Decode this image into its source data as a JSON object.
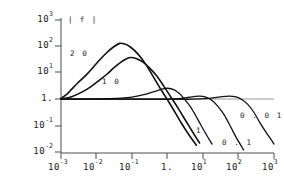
{
  "chart_data": {
    "type": "line",
    "title": "",
    "subtitle": "",
    "ylabel": "| f |",
    "xlabel": "",
    "xscale": "log",
    "yscale": "log",
    "xlim": [
      0.001,
      1000
    ],
    "ylim": [
      0.01,
      1000
    ],
    "grid": false,
    "legend_position": "inline-annotations",
    "axis_caption": "| f |",
    "x_ticks": [
      {
        "value": 0.001,
        "mantissa": "10",
        "exponent": "-3",
        "label": "10^-3"
      },
      {
        "value": 0.01,
        "mantissa": "10",
        "exponent": "-2",
        "label": "10^-2"
      },
      {
        "value": 0.1,
        "mantissa": "10",
        "exponent": "-1",
        "label": "10^-1"
      },
      {
        "value": 1,
        "mantissa": "1.",
        "exponent": "",
        "label": "1."
      },
      {
        "value": 10,
        "mantissa": "10",
        "exponent": "1",
        "label": "10^1"
      },
      {
        "value": 100,
        "mantissa": "10",
        "exponent": "2",
        "label": "10^2"
      },
      {
        "value": 1000,
        "mantissa": "10",
        "exponent": "3",
        "label": "10^3"
      }
    ],
    "y_ticks": [
      {
        "value": 1000,
        "mantissa": "10",
        "exponent": "3",
        "label": "10^3"
      },
      {
        "value": 100,
        "mantissa": "10",
        "exponent": "2",
        "label": "10^2"
      },
      {
        "value": 10,
        "mantissa": "10",
        "exponent": "1",
        "label": "10^1"
      },
      {
        "value": 1,
        "mantissa": "1.",
        "exponent": "",
        "label": "1."
      },
      {
        "value": 0.1,
        "mantissa": "10",
        "exponent": "-1",
        "label": "10^-1"
      },
      {
        "value": 0.01,
        "mantissa": "10",
        "exponent": "-2",
        "label": "10^-2"
      }
    ],
    "series": [
      {
        "name": "20",
        "label": "2 0",
        "label_x": 0.0045,
        "label_y": 33,
        "peak_x": 0.045,
        "peak_y": 130,
        "color": "#111111",
        "width": 1.6,
        "points": [
          [
            0.001,
            1.05
          ],
          [
            0.0015,
            1.6
          ],
          [
            0.002,
            2.4
          ],
          [
            0.003,
            4.2
          ],
          [
            0.005,
            8.0
          ],
          [
            0.008,
            16
          ],
          [
            0.012,
            30
          ],
          [
            0.02,
            60
          ],
          [
            0.03,
            95
          ],
          [
            0.045,
            130
          ],
          [
            0.06,
            125
          ],
          [
            0.09,
            95
          ],
          [
            0.15,
            50
          ],
          [
            0.25,
            20
          ],
          [
            0.4,
            7.0
          ],
          [
            0.7,
            2.0
          ],
          [
            1.0,
            0.95
          ],
          [
            1.6,
            0.33
          ],
          [
            2.5,
            0.12
          ],
          [
            4.0,
            0.045
          ],
          [
            6.5,
            0.018
          ],
          [
            10,
            0.0085
          ]
        ]
      },
      {
        "name": "10",
        "label": "1 0",
        "label_x": 0.022,
        "label_y": 5.5,
        "peak_x": 0.09,
        "peak_y": 38,
        "color": "#111111",
        "width": 1.6,
        "points": [
          [
            0.001,
            1.02
          ],
          [
            0.002,
            1.25
          ],
          [
            0.004,
            1.9
          ],
          [
            0.007,
            3.0
          ],
          [
            0.012,
            5.2
          ],
          [
            0.02,
            9.0
          ],
          [
            0.03,
            15
          ],
          [
            0.05,
            26
          ],
          [
            0.07,
            34
          ],
          [
            0.09,
            38
          ],
          [
            0.13,
            35
          ],
          [
            0.2,
            26
          ],
          [
            0.3,
            16
          ],
          [
            0.5,
            7.5
          ],
          [
            0.8,
            3.0
          ],
          [
            1.2,
            1.3
          ],
          [
            2.0,
            0.45
          ],
          [
            3.2,
            0.16
          ],
          [
            5.0,
            0.06
          ],
          [
            8.0,
            0.022
          ],
          [
            13,
            0.0095
          ]
        ]
      },
      {
        "name": "1",
        "label": "1",
        "label_x": 25,
        "label_y": 0.1,
        "peak_x": 1.0,
        "peak_y": 2.6,
        "color": "#111111",
        "width": 1.3,
        "points": [
          [
            0.001,
            1.0
          ],
          [
            0.01,
            1.02
          ],
          [
            0.05,
            1.1
          ],
          [
            0.1,
            1.2
          ],
          [
            0.2,
            1.45
          ],
          [
            0.4,
            1.9
          ],
          [
            0.7,
            2.4
          ],
          [
            1.0,
            2.6
          ],
          [
            1.5,
            2.3
          ],
          [
            2.2,
            1.6
          ],
          [
            3.0,
            1.0
          ],
          [
            4.5,
            0.5
          ],
          [
            7.0,
            0.18
          ],
          [
            11,
            0.06
          ],
          [
            18,
            0.02
          ],
          [
            28,
            0.0085
          ]
        ]
      },
      {
        "name": "0.1",
        "label": "0 . 1",
        "label_x": 220,
        "label_y": 0.045,
        "peak_x": 8,
        "peak_y": 1.3,
        "color": "#111111",
        "width": 1.3,
        "points": [
          [
            0.001,
            1.0
          ],
          [
            0.1,
            1.0
          ],
          [
            0.5,
            1.0
          ],
          [
            1.0,
            1.0
          ],
          [
            2.0,
            1.05
          ],
          [
            3.5,
            1.15
          ],
          [
            5.5,
            1.25
          ],
          [
            8.0,
            1.3
          ],
          [
            12,
            1.2
          ],
          [
            18,
            0.9
          ],
          [
            26,
            0.55
          ],
          [
            40,
            0.25
          ],
          [
            60,
            0.09
          ],
          [
            90,
            0.032
          ],
          [
            140,
            0.012
          ],
          [
            200,
            0.006
          ]
        ]
      },
      {
        "name": "0.01",
        "label": "0 . 0 1",
        "label_x": 330,
        "label_y": 0.17,
        "peak_x": 55,
        "peak_y": 1.3,
        "color": "#111111",
        "width": 1.3,
        "points": [
          [
            0.001,
            1.0
          ],
          [
            1.0,
            1.0
          ],
          [
            5.0,
            1.0
          ],
          [
            12,
            1.05
          ],
          [
            22,
            1.15
          ],
          [
            35,
            1.25
          ],
          [
            55,
            1.3
          ],
          [
            80,
            1.25
          ],
          [
            120,
            1.0
          ],
          [
            180,
            0.65
          ],
          [
            270,
            0.32
          ],
          [
            400,
            0.13
          ],
          [
            600,
            0.055
          ],
          [
            850,
            0.028
          ],
          [
            1000,
            0.02
          ]
        ]
      }
    ],
    "reference_line": {
      "name": "unity-line",
      "value": 1,
      "color": "#9a9a9a"
    }
  },
  "axes": {
    "y_axis_color": "#4d4d4d",
    "x_axis_color": "#4d4d4d",
    "tick_color": "#4d4d4d"
  }
}
